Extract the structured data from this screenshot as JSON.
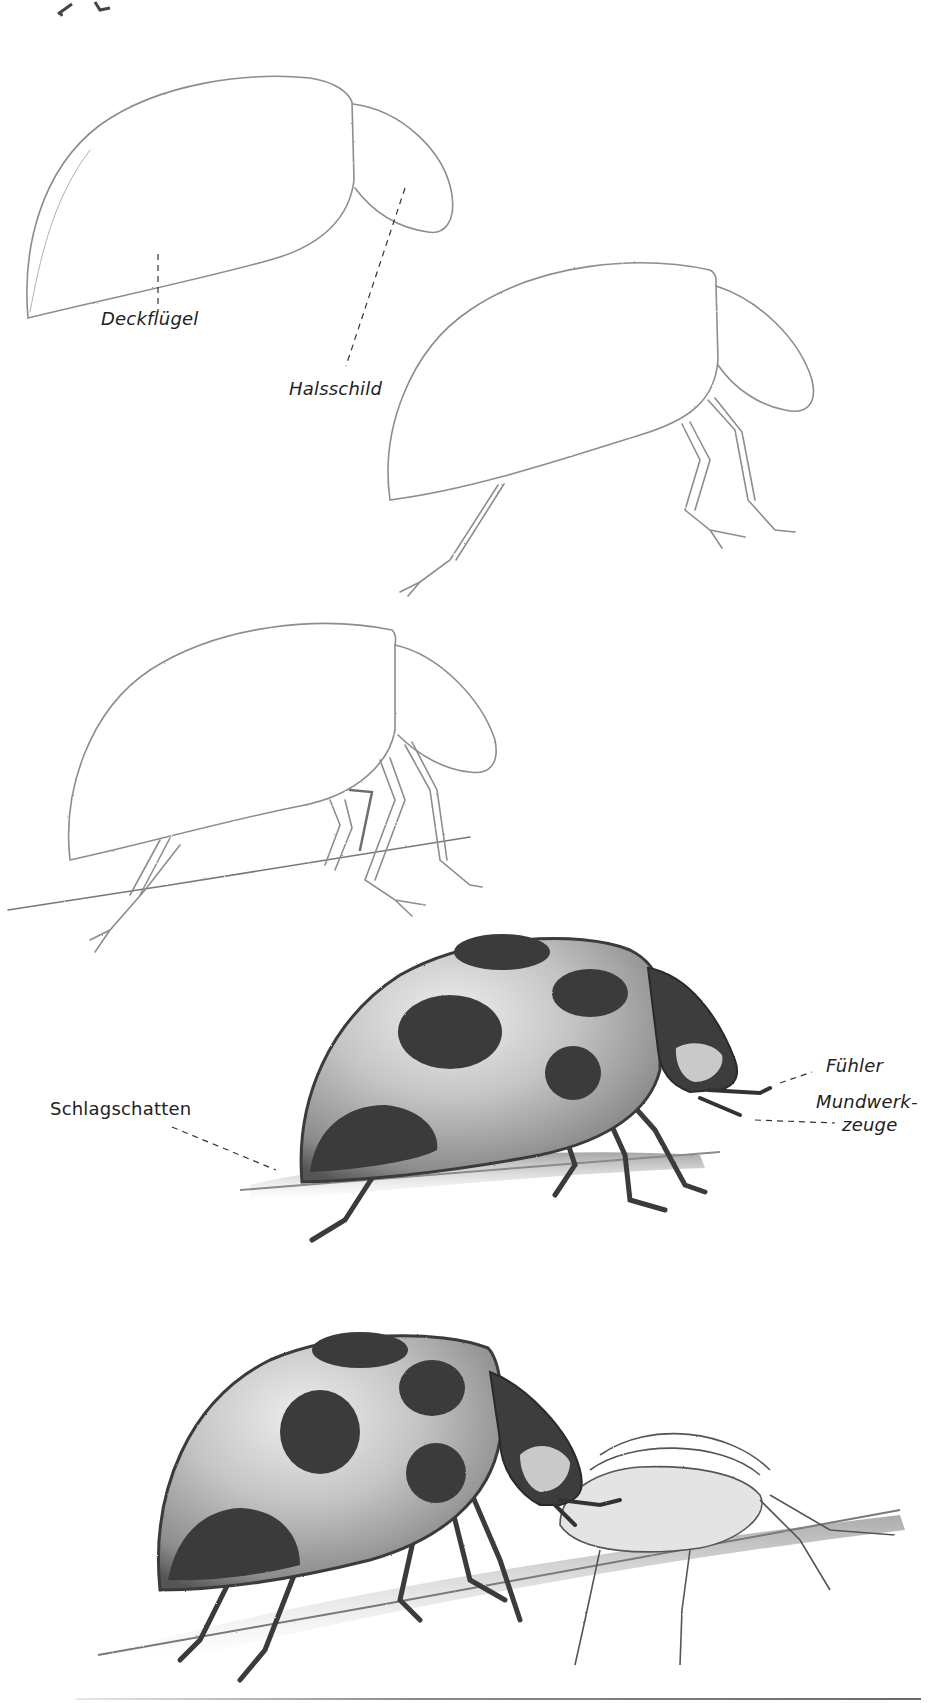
{
  "page": {
    "type": "drawing-tutorial",
    "medium": "graphite pencil sketch on white paper"
  },
  "steps": [
    {
      "index": 1,
      "description": "Basic shapes: large dome for wing covers, smaller oval for pronotum",
      "labels": {
        "wing_covers": "Deckflügel",
        "pronotum": "Halsschild"
      }
    },
    {
      "index": 2,
      "description": "Legs added to the outline"
    },
    {
      "index": 3,
      "description": "All legs and a ground line (twig) added"
    },
    {
      "index": 4,
      "description": "Shaded ladybug with spots, head, antennae and mouthparts",
      "labels": {
        "antennae": "Fühler",
        "mouthparts_line1": "Mundwerk-",
        "mouthparts_line2": "zeuge",
        "cast_shadow": "Schlagschatten"
      }
    },
    {
      "index": 5,
      "description": "Finished ladybug eating an aphid on a twig"
    }
  ],
  "colors": {
    "paper": "#ffffff",
    "pencil_light": "#9a9a9a",
    "pencil_mid": "#6e6e6e",
    "pencil_dark": "#333333",
    "label_text": "#222222"
  }
}
